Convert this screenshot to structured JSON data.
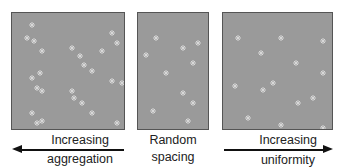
{
  "panels": [
    {
      "id": "aggregated",
      "points": [
        [
          20,
          12
        ],
        [
          15,
          25
        ],
        [
          22,
          28
        ],
        [
          30,
          38
        ],
        [
          60,
          35
        ],
        [
          68,
          43
        ],
        [
          72,
          52
        ],
        [
          80,
          58
        ],
        [
          100,
          20
        ],
        [
          105,
          30
        ],
        [
          20,
          65
        ],
        [
          28,
          60
        ],
        [
          25,
          75
        ],
        [
          30,
          78
        ],
        [
          60,
          78
        ],
        [
          62,
          85
        ],
        [
          70,
          90
        ],
        [
          100,
          68
        ],
        [
          110,
          70
        ],
        [
          20,
          100
        ],
        [
          25,
          110
        ],
        [
          30,
          108
        ],
        [
          80,
          100
        ],
        [
          105,
          110
        ],
        [
          90,
          38
        ]
      ]
    },
    {
      "id": "random",
      "points": [
        [
          18,
          25
        ],
        [
          45,
          35
        ],
        [
          60,
          30
        ],
        [
          8,
          42
        ],
        [
          55,
          50
        ],
        [
          28,
          60
        ],
        [
          45,
          80
        ],
        [
          55,
          90
        ],
        [
          15,
          98
        ],
        [
          50,
          108
        ]
      ]
    },
    {
      "id": "uniform",
      "points": [
        [
          15,
          25
        ],
        [
          58,
          25
        ],
        [
          100,
          28
        ],
        [
          38,
          40
        ],
        [
          73,
          50
        ],
        [
          100,
          60
        ],
        [
          12,
          73
        ],
        [
          50,
          70
        ],
        [
          40,
          77
        ],
        [
          75,
          90
        ],
        [
          90,
          85
        ],
        [
          25,
          105
        ],
        [
          58,
          112
        ],
        [
          100,
          115
        ]
      ]
    }
  ],
  "labels": {
    "left_line1": "Increasing",
    "left_line2": "aggregation",
    "mid_line1": "Random",
    "mid_line2": "spacing",
    "right_line1": "Increasing",
    "right_line2": "uniformity"
  },
  "colors": {
    "panel": "#9a9a9a",
    "border": "#555555",
    "mark": "#d8d8d8",
    "arrow": "#111111"
  }
}
